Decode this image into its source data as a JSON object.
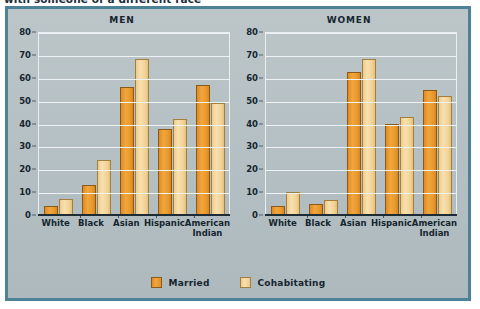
{
  "figure": {
    "caption": "with someone of a different race"
  },
  "legend": {
    "position": "bottom-center",
    "items": [
      {
        "label": "Married",
        "color": "#ED9B33",
        "key": "married"
      },
      {
        "label": "Cohabitating",
        "color": "#F5D598",
        "key": "cohabitating"
      }
    ]
  },
  "colors": {
    "panel_background": "#B4BFC3",
    "panel_border": "#4C8196",
    "married": "#ED9B33",
    "cohabitating": "#F5D598",
    "axis": "#1C2B34",
    "gridline": "#EEF2F4",
    "text": "#15252F"
  },
  "chart_data": [
    {
      "type": "bar",
      "title": "MEN",
      "xlabel": "",
      "ylabel": "",
      "ylim": [
        0,
        80
      ],
      "yticks": [
        0,
        10,
        20,
        30,
        40,
        50,
        60,
        70,
        80
      ],
      "grid": true,
      "categories": [
        "White",
        "Black",
        "Asian",
        "Hispanic",
        "American Indian"
      ],
      "series": [
        {
          "name": "Married",
          "values": [
            4,
            13,
            56,
            37.5,
            57
          ]
        },
        {
          "name": "Cohabitating",
          "values": [
            7,
            24,
            68,
            42,
            49
          ]
        }
      ]
    },
    {
      "type": "bar",
      "title": "WOMEN",
      "xlabel": "",
      "ylabel": "",
      "ylim": [
        0,
        80
      ],
      "yticks": [
        0,
        10,
        20,
        30,
        40,
        50,
        60,
        70,
        80
      ],
      "grid": true,
      "categories": [
        "White",
        "Black",
        "Asian",
        "Hispanic",
        "American Indian"
      ],
      "series": [
        {
          "name": "Married",
          "values": [
            4,
            5,
            62.5,
            40,
            54.5
          ]
        },
        {
          "name": "Cohabitating",
          "values": [
            10,
            6.5,
            68,
            43,
            52
          ]
        }
      ]
    }
  ]
}
